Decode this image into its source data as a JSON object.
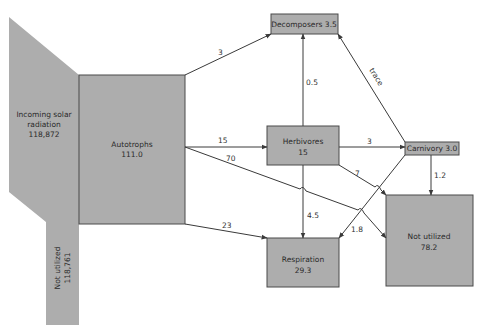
{
  "colors": {
    "node_fill": "#adadad",
    "node_stroke": "#4a4a4a",
    "arrow": "#3a3a3a",
    "background": "#ffffff"
  },
  "nodes": {
    "solar": {
      "label_lines": [
        "Incoming solar",
        "radiation",
        "118,872"
      ]
    },
    "not_utilized_solar": {
      "label_lines": [
        "Not utilized",
        "118,761"
      ]
    },
    "autotrophs": {
      "label_lines": [
        "Autotrophs",
        "111.0"
      ]
    },
    "decomposers": {
      "label": "Decomposers 3.5"
    },
    "herbivores": {
      "label_lines": [
        "Herbivores",
        "15"
      ]
    },
    "carnivory": {
      "label": "Carnivory 3.0"
    },
    "respiration": {
      "label_lines": [
        "Respiration",
        "29.3"
      ]
    },
    "not_utilized": {
      "label_lines": [
        "Not utilized",
        "78.2"
      ]
    }
  },
  "flows": {
    "autotrophs_to_decomposers": "3",
    "autotrophs_to_herbivores": "15",
    "autotrophs_to_not_utilized": "70",
    "autotrophs_to_respiration": "23",
    "herbivores_to_decomposers": "0.5",
    "herbivores_to_carnivory": "3",
    "herbivores_to_not_utilized": "7",
    "herbivores_to_respiration": "4.5",
    "carnivory_to_decomposers": "trace",
    "carnivory_to_not_utilized": "1.2",
    "carnivory_to_respiration": "1.8"
  }
}
